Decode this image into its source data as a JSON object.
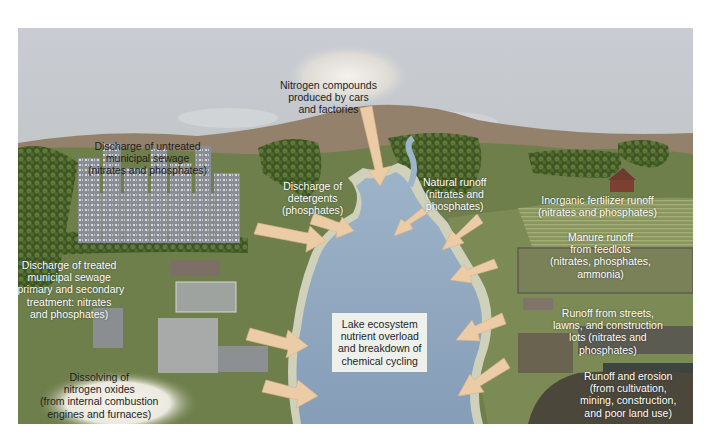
{
  "diagram": {
    "colors": {
      "sky_top": "#c9cdd3",
      "sky_bottom": "#aeb2ae",
      "hills": "#8d7d6a",
      "land": "#6d7d4c",
      "land_dark": "#55663a",
      "lake": "#8fa7c0",
      "lake_shore": "#c8cab2",
      "arrow": "#e9c9a2",
      "center_box": "#eef0ec",
      "label_text": "#ffffff",
      "dark_text": "#1e1e1e"
    },
    "center": {
      "lines": [
        "Lake ecosystem",
        "nutrient overload",
        "and breakdown of",
        "chemical cycling"
      ]
    },
    "sources": [
      {
        "id": "air",
        "lines": [
          "Nitrogen compounds",
          "produced by cars",
          "and factories"
        ]
      },
      {
        "id": "untreated-sewage",
        "lines": [
          "Discharge of untreated",
          "municipal sewage",
          "(nitrates and phosphates)"
        ]
      },
      {
        "id": "detergents",
        "lines": [
          "Discharge of",
          "detergents",
          "(phosphates)"
        ]
      },
      {
        "id": "natural-runoff",
        "lines": [
          "Natural runoff",
          "(nitrates and",
          "phosphates)"
        ]
      },
      {
        "id": "fertilizer",
        "lines": [
          "Inorganic fertilizer runoff",
          "(nitrates and phosphates)"
        ]
      },
      {
        "id": "manure",
        "lines": [
          "Manure runoff",
          "from feedlots",
          "(nitrates, phosphates,",
          "ammonia)"
        ]
      },
      {
        "id": "treated-sewage",
        "lines": [
          "Discharge of treated",
          "municipal sewage",
          "(primary and secondary",
          "treatment: nitrates",
          "and phosphates)"
        ]
      },
      {
        "id": "streets",
        "lines": [
          "Runoff from streets,",
          "lawns, and construction",
          "lots (nitrates and",
          "phosphates)"
        ]
      },
      {
        "id": "nitrogen-oxides",
        "lines": [
          "Dissolving of",
          "nitrogen oxides",
          "(from internal combustion",
          "engines and furnaces)"
        ]
      },
      {
        "id": "erosion",
        "lines": [
          "Runoff and erosion",
          "(from cultivation,",
          "mining, construction,",
          "and poor land use)"
        ]
      }
    ]
  }
}
